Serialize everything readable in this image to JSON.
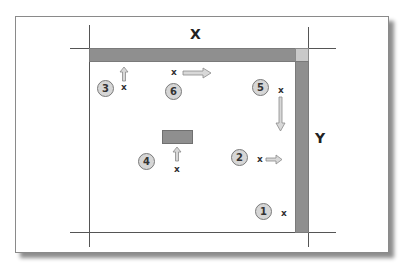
{
  "diagram": {
    "axis_x_label": "X",
    "axis_y_label": "Y",
    "colors": {
      "bar": "#8f8f8f",
      "corner": "#c9c9c9",
      "badge": "#d6d6d6",
      "arrow": "#cfcfcf"
    },
    "markers": [
      {
        "number": "1",
        "label": "x",
        "arrow": "none"
      },
      {
        "number": "2",
        "label": "x",
        "arrow": "right"
      },
      {
        "number": "3",
        "label": "x",
        "arrow": "up"
      },
      {
        "number": "4",
        "label": "x",
        "arrow": "up"
      },
      {
        "number": "5",
        "label": "x",
        "arrow": "down"
      },
      {
        "number": "6",
        "label": "x",
        "arrow": "right"
      }
    ]
  }
}
